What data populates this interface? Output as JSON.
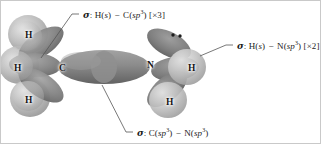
{
  "figure": {
    "kind": "orbital-overlap-diagram",
    "molecule": "methylamine",
    "background_color": "#ffffff",
    "border_color": "#c9c9c9",
    "orbital_color": "#8a8a8a",
    "sphere_color": "#b9b9b9",
    "leader_color": "#555555",
    "text_color": "#1c1c1c"
  },
  "atoms": [
    {
      "id": "atom-c",
      "label": "C",
      "x": 58,
      "y": 63
    },
    {
      "id": "atom-n",
      "label": "N",
      "x": 146,
      "y": 60
    },
    {
      "id": "atom-h-c-top",
      "label": "H",
      "x": 24,
      "y": 30
    },
    {
      "id": "atom-h-c-mid",
      "label": "H",
      "x": 13,
      "y": 63
    },
    {
      "id": "atom-h-c-bottom",
      "label": "H",
      "x": 24,
      "y": 95
    },
    {
      "id": "atom-h-n-right",
      "label": "H",
      "x": 187,
      "y": 63
    },
    {
      "id": "atom-h-n-bottom",
      "label": "H",
      "x": 165,
      "y": 97
    }
  ],
  "labels": {
    "ch_bond": {
      "id": "label-sigma-hs-csp3",
      "sigma": "σ",
      "colon": ":",
      "first": "H(",
      "first_italic": "s",
      "first_close": ")",
      "dash": "−",
      "second": "C(",
      "second_italic": "sp",
      "second_sup": "3",
      "second_close": ")",
      "multiplier": "[×3]",
      "text": "σ: H(s) − C(sp3) [×3]"
    },
    "nh_bond": {
      "id": "label-sigma-hs-nsp3",
      "sigma": "σ",
      "colon": ":",
      "first": "H(",
      "first_italic": "s",
      "first_close": ")",
      "dash": "−",
      "second": "N(",
      "second_italic": "sp",
      "second_sup": "3",
      "second_close": ")",
      "multiplier": "[×2]",
      "text": "σ: H(s) − N(sp3) [×2]"
    },
    "cn_bond": {
      "id": "label-sigma-csp3-nsp3",
      "sigma": "σ",
      "colon": ":",
      "first": "C(",
      "first_italic": "sp",
      "first_sup": "3",
      "first_close": ")",
      "dash": "−",
      "second": "N(",
      "second_italic": "sp",
      "second_sup": "3",
      "second_close": ")",
      "multiplier": "",
      "text": "σ: C(sp3) − N(sp3)"
    }
  },
  "lone_pair": {
    "id": "nitrogen-lone-pair",
    "dot_count": 2,
    "on_atom": "N"
  }
}
